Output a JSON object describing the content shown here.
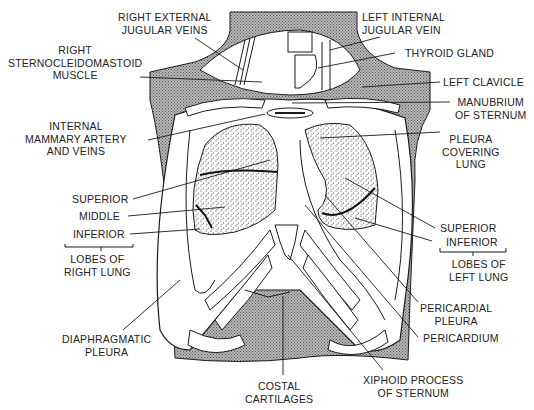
{
  "diagram": {
    "colors": {
      "background": "#ffffff",
      "line": "#1a1a1a",
      "shading": "#9a9a9a",
      "lung_fill": "#e6e6e6",
      "text": "#222222"
    },
    "labels": {
      "right_external_jugular": [
        "RIGHT EXTERNAL",
        "JUGULAR VEINS"
      ],
      "right_sternocleidomastoid": [
        "RIGHT",
        "STERNOCLEIDOMASTOID",
        "MUSCLE"
      ],
      "internal_mammary": [
        "INTERNAL",
        "MAMMARY ARTERY",
        "AND VEINS"
      ],
      "superior_right": "SUPERIOR",
      "middle_right": "MIDDLE",
      "inferior_right": "INFERIOR",
      "lobes_right": [
        "LOBES OF",
        "RIGHT LUNG"
      ],
      "diaphragmatic_pleura": [
        "DIAPHRAGMATIC",
        "PLEURA"
      ],
      "costal_cartilages": [
        "COSTAL",
        "CARTILAGES"
      ],
      "xiphoid": [
        "XIPHOID PROCESS",
        "OF STERNUM"
      ],
      "pericardium": "PERICARDIUM",
      "pericardial_pleura": [
        "PERICARDIAL",
        "PLEURA"
      ],
      "lobes_left": [
        "LOBES OF",
        "LEFT LUNG"
      ],
      "superior_left": "SUPERIOR",
      "inferior_left": "INFERIOR",
      "pleura_covering_lung": [
        "PLEURA",
        "COVERING",
        "LUNG"
      ],
      "manubrium": [
        "MANUBRIUM",
        "OF STERNUM"
      ],
      "left_clavicle": "LEFT CLAVICLE",
      "thyroid_gland": "THYROID GLAND",
      "left_internal_jugular": [
        "LEFT INTERNAL",
        "JUGULAR VEIN"
      ]
    }
  }
}
